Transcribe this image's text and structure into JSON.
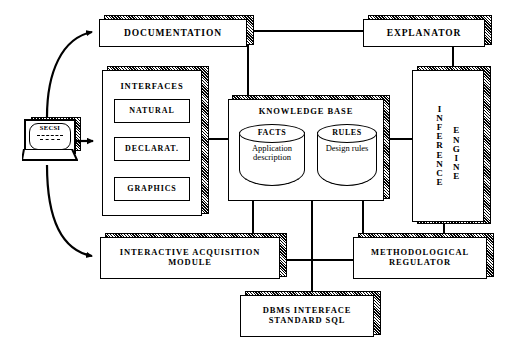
{
  "diagram": {
    "source_device": {
      "label": "SECSI",
      "icon": "laptop-icon"
    },
    "nodes": {
      "documentation": {
        "label": "DOCUMENTATION"
      },
      "explanator": {
        "label": "EXPLANATOR"
      },
      "interfaces": {
        "label": "INTERFACES",
        "items": [
          {
            "label": "NATURAL"
          },
          {
            "label": "DECLARAT."
          },
          {
            "label": "GRAPHICS"
          }
        ]
      },
      "knowledge_base": {
        "label": "KNOWLEDGE  BASE",
        "stores": [
          {
            "cap": "FACTS",
            "body": "Application description"
          },
          {
            "cap": "RULES",
            "body": "Design rules"
          }
        ]
      },
      "inference_engine": {
        "label": "INFERENCE ENGINE",
        "col1": "INFERENCE",
        "col2": "ENGINE"
      },
      "interactive_acquisition": {
        "line1": "INTERACTIVE  ACQUISITION",
        "line2": "MODULE"
      },
      "methodological_regulator": {
        "line1": "METHODOLOGICAL",
        "line2": "REGULATOR"
      },
      "dbms": {
        "line1": "DBMS  INTERFACE",
        "line2": "STANDARD  SQL"
      }
    },
    "colors": {
      "ink": "#000000",
      "paper": "#ffffff"
    }
  }
}
